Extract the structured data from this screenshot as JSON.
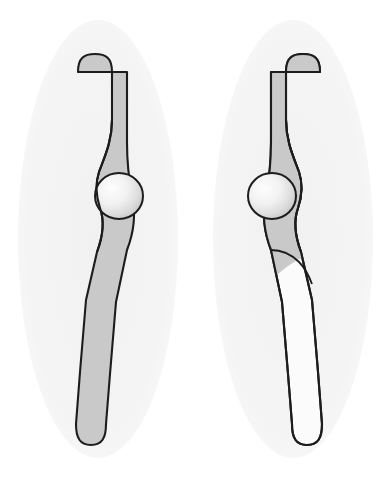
{
  "document": {
    "title": "Paired anatomical limb diagram",
    "description": "Two mirrored S-curved tubular structures, each on a pale vertical ellipse background, with a spherical joint at the mid inflection.",
    "background_color": "#ffffff",
    "width": 391,
    "height": 477
  },
  "palette": {
    "page_background": "#ffffff",
    "ellipse_fill": "#f4f4f4",
    "limb_fill_gray": "#c9c9c9",
    "limb_fill_white": "#fbfbfb",
    "outline": "#1c1c1c",
    "sphere_highlight": "#fdfdfd",
    "sphere_edge": "#c2c2c2"
  },
  "panels": [
    {
      "id": "left-panel",
      "name": "left-figure",
      "label": "Left figure",
      "mirrored": false,
      "ellipse": {
        "cx": 98,
        "cy": 239,
        "rx": 80,
        "ry": 219,
        "fill": "#f4f4f4"
      },
      "limb": {
        "fill": "#c9c9c9",
        "lower_segment_fill": "#c9c9c9",
        "outline_width": 2.1,
        "top_cap_x_range": [
          78,
          112
        ],
        "top_cap_y": 54,
        "bottom_cap_x_range": [
          76,
          106
        ],
        "bottom_cap_y": 445
      },
      "sphere": {
        "name": "joint-sphere",
        "cx": 119,
        "cy": 196,
        "rx": 24,
        "ry": 23,
        "side": "right",
        "highlight_offset": [
          -0.28,
          -0.2
        ]
      },
      "has_lower_division_line": false
    },
    {
      "id": "right-panel",
      "name": "right-figure",
      "label": "Right figure",
      "mirrored": true,
      "ellipse": {
        "cx": 293,
        "cy": 239,
        "rx": 80,
        "ry": 219,
        "fill": "#f4f4f4"
      },
      "limb": {
        "fill": "#c9c9c9",
        "lower_segment_fill": "#fbfbfb",
        "outline_width": 2.1,
        "top_cap_x_range": [
          288,
          320
        ],
        "top_cap_y": 54,
        "bottom_cap_x_range": [
          286,
          316
        ],
        "bottom_cap_y": 445
      },
      "sphere": {
        "name": "joint-sphere",
        "cx": 272,
        "cy": 196,
        "rx": 24,
        "ry": 23,
        "side": "left",
        "highlight_offset": [
          -0.28,
          -0.2
        ]
      },
      "has_lower_division_line": true,
      "division_line_y": 252
    }
  ]
}
